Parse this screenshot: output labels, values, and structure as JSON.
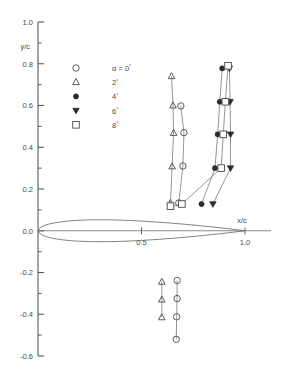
{
  "chart_data": {
    "type": "scatter",
    "title": "",
    "subtitle": "",
    "xlabel": "x/c",
    "ylabel": "y/c",
    "xlim": [
      -0.08,
      1.16
    ],
    "ylim": [
      -0.65,
      1.0
    ],
    "grid": false,
    "legend_position": "upper-left-inside",
    "x_ticks_major": [
      0.5,
      1.0
    ],
    "x_tick_labels": [
      "0.5",
      "1.0"
    ],
    "y_ticks_major": [
      1.0,
      0.8,
      0.6,
      0.4,
      0.2,
      0.0,
      -0.2,
      -0.4,
      -0.6
    ],
    "y_tick_labels": [
      "1.0",
      "0.8",
      "0.6",
      "0.4",
      "0.2",
      "0.0",
      "-0.2",
      "-0.4",
      "-0.6"
    ],
    "y_ticks_minor": [
      0.9,
      0.7,
      0.5,
      0.3,
      0.1,
      -0.1,
      -0.3,
      -0.5
    ],
    "legend": [
      {
        "symbol": "open-circle",
        "label": "α = 0°",
        "alpha": "0"
      },
      {
        "symbol": "open-triangle-up",
        "label": "2°",
        "alpha": "2"
      },
      {
        "symbol": "filled-circle",
        "label": "4°",
        "alpha": "4"
      },
      {
        "symbol": "filled-triangle-down",
        "label": "6°",
        "alpha": "6"
      },
      {
        "symbol": "open-square",
        "label": "8°",
        "alpha": "8"
      }
    ],
    "series": [
      {
        "name": "α = 0°",
        "symbol": "open-circle",
        "points": [
          {
            "x": 0.68,
            "y": 0.133
          },
          {
            "x": 0.7,
            "y": 0.31
          },
          {
            "x": 0.705,
            "y": 0.47
          },
          {
            "x": 0.69,
            "y": 0.598
          },
          {
            "x": 0.672,
            "y": -0.238
          },
          {
            "x": 0.672,
            "y": -0.325
          },
          {
            "x": 0.67,
            "y": -0.412
          },
          {
            "x": 0.668,
            "y": -0.52
          }
        ]
      },
      {
        "name": "α = 2°",
        "symbol": "open-triangle-up",
        "points": [
          {
            "x": 0.64,
            "y": 0.133
          },
          {
            "x": 0.648,
            "y": 0.308
          },
          {
            "x": 0.655,
            "y": 0.468
          },
          {
            "x": 0.652,
            "y": 0.6
          },
          {
            "x": 0.645,
            "y": 0.74
          },
          {
            "x": 0.598,
            "y": -0.245
          },
          {
            "x": 0.598,
            "y": -0.33
          },
          {
            "x": 0.598,
            "y": -0.415
          }
        ]
      },
      {
        "name": "α = 4°",
        "symbol": "filled-circle",
        "points": [
          {
            "x": 0.79,
            "y": 0.128
          },
          {
            "x": 0.855,
            "y": 0.3
          },
          {
            "x": 0.868,
            "y": 0.462
          },
          {
            "x": 0.878,
            "y": 0.618
          },
          {
            "x": 0.89,
            "y": 0.778
          }
        ]
      },
      {
        "name": "α = 6°",
        "symbol": "filled-triangle-down",
        "points": [
          {
            "x": 0.845,
            "y": 0.128
          },
          {
            "x": 0.93,
            "y": 0.3
          },
          {
            "x": 0.93,
            "y": 0.462
          },
          {
            "x": 0.928,
            "y": 0.618
          },
          {
            "x": 0.925,
            "y": 0.778
          }
        ]
      },
      {
        "name": "α = 8°",
        "symbol": "open-square",
        "points": [
          {
            "x": 0.64,
            "y": 0.118
          },
          {
            "x": 0.695,
            "y": 0.128
          },
          {
            "x": 0.885,
            "y": 0.3
          },
          {
            "x": 0.895,
            "y": 0.462
          },
          {
            "x": 0.905,
            "y": 0.618
          },
          {
            "x": 0.918,
            "y": 0.79
          }
        ]
      }
    ],
    "airfoil": {
      "name": "airfoil-section-outline",
      "chord_start": 0.0,
      "chord_end": 1.0,
      "max_thickness": 0.105,
      "thickness_location": 0.32
    }
  }
}
